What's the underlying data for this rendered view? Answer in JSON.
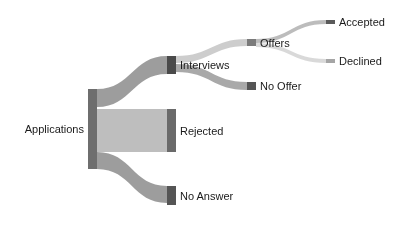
{
  "chart_data": {
    "type": "sankey",
    "title": "",
    "nodes": [
      {
        "id": "applications",
        "label": "Applications",
        "column": 0,
        "x": 88,
        "y": 89,
        "w": 9,
        "h": 80,
        "color": "#6e6e6e",
        "label_side": "left"
      },
      {
        "id": "interviews",
        "label": "Interviews",
        "column": 1,
        "x": 167,
        "y": 56,
        "w": 9,
        "h": 18,
        "color": "#4a4a4a",
        "label_side": "right"
      },
      {
        "id": "rejected",
        "label": "Rejected",
        "column": 1,
        "x": 167,
        "y": 109,
        "w": 9,
        "h": 43,
        "color": "#6a6a6a",
        "label_side": "right"
      },
      {
        "id": "no_answer",
        "label": "No Answer",
        "column": 1,
        "x": 167,
        "y": 186,
        "w": 9,
        "h": 19,
        "color": "#555555",
        "label_side": "right"
      },
      {
        "id": "offers",
        "label": "Offers",
        "column": 2,
        "x": 247,
        "y": 39,
        "w": 9,
        "h": 7,
        "color": "#7a7a7a",
        "label_side": "right"
      },
      {
        "id": "no_offer",
        "label": "No Offer",
        "column": 2,
        "x": 247,
        "y": 82,
        "w": 9,
        "h": 8,
        "color": "#555555",
        "label_side": "right"
      },
      {
        "id": "accepted",
        "label": "Accepted",
        "column": 3,
        "x": 326,
        "y": 20,
        "w": 9,
        "h": 4,
        "color": "#5a5a5a",
        "label_side": "right"
      },
      {
        "id": "declined",
        "label": "Declined",
        "column": 3,
        "x": 326,
        "y": 59,
        "w": 9,
        "h": 4,
        "color": "#a5a5a5",
        "label_side": "right"
      }
    ],
    "links": [
      {
        "source": "applications",
        "target": "interviews",
        "value": 18,
        "sy": 89,
        "ty": 56,
        "h": 18,
        "color": "#8c8c8c",
        "opacity": 0.85
      },
      {
        "source": "applications",
        "target": "rejected",
        "value": 43,
        "sy": 109,
        "ty": 109,
        "h": 43,
        "color": "#b3b3b3",
        "opacity": 0.85
      },
      {
        "source": "applications",
        "target": "no_answer",
        "value": 19,
        "sy": 152,
        "ty": 186,
        "h": 17,
        "color": "#8c8c8c",
        "opacity": 0.85
      },
      {
        "source": "interviews",
        "target": "offers",
        "value": 8,
        "sy": 56,
        "ty": 39,
        "h": 7,
        "color": "#c4c4c4",
        "opacity": 0.85
      },
      {
        "source": "interviews",
        "target": "no_offer",
        "value": 10,
        "sy": 64,
        "ty": 82,
        "h": 8,
        "color": "#9a9a9a",
        "opacity": 0.85
      },
      {
        "source": "offers",
        "target": "accepted",
        "value": 4,
        "sy": 39,
        "ty": 20,
        "h": 4,
        "color": "#b0b0b0",
        "opacity": 0.85
      },
      {
        "source": "offers",
        "target": "declined",
        "value": 4,
        "sy": 43,
        "ty": 59,
        "h": 4,
        "color": "#d2d2d2",
        "opacity": 0.85
      }
    ],
    "legend": null,
    "grid": false
  }
}
